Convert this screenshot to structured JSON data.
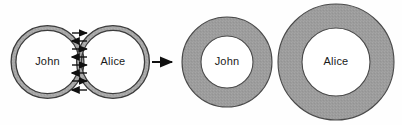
{
  "diagram": {
    "background_color": "#fefefe",
    "before": {
      "name": "before-state",
      "description": "Two thin overlapping rings exchanging messages",
      "circles": [
        {
          "id": "john",
          "label": "John",
          "cx": 47.5,
          "cy": 62,
          "r": 34,
          "ring_thickness": 3.5,
          "ring_fill": "#a8a8a8",
          "stroke": "#3c3c3c",
          "interior_fill": "#ffffff",
          "label_x": 47.5,
          "label_y": 62
        },
        {
          "id": "alice",
          "label": "Alice",
          "cx": 113,
          "cy": 62,
          "r": 34,
          "ring_thickness": 3.5,
          "ring_fill": "#a8a8a8",
          "stroke": "#3c3c3c",
          "interior_fill": "#ffffff",
          "label_x": 113,
          "label_y": 62
        }
      ],
      "exchange_arrows": {
        "name": "message-exchange-arrows",
        "count": 8,
        "color": "#101010",
        "axis_x": 80,
        "items": [
          {
            "y": 33,
            "direction": "right"
          },
          {
            "y": 41,
            "direction": "left"
          },
          {
            "y": 49,
            "direction": "right"
          },
          {
            "y": 57,
            "direction": "left"
          },
          {
            "y": 65,
            "direction": "right"
          },
          {
            "y": 73,
            "direction": "left"
          },
          {
            "y": 81,
            "direction": "right"
          },
          {
            "y": 90,
            "direction": "left"
          }
        ]
      }
    },
    "transition_arrow": {
      "name": "transition-arrow",
      "symbol": "→",
      "direction": "right",
      "color": "#101010",
      "x1": 152,
      "x2": 174,
      "y": 62
    },
    "after": {
      "name": "after-state",
      "description": "Two thick separate annuli, touching",
      "circles": [
        {
          "id": "john",
          "label": "John",
          "cx": 227,
          "cy": 62,
          "r_outer": 45,
          "r_inner": 26,
          "ring_fill": "#9c9c9c",
          "stroke": "#4a4a4a",
          "interior_fill": "#ffffff",
          "label_x": 227,
          "label_y": 62
        },
        {
          "id": "alice",
          "label": "Alice",
          "cx": 336,
          "cy": 62,
          "r_outer": 58,
          "r_inner": 34,
          "ring_fill": "#9c9c9c",
          "stroke": "#4a4a4a",
          "interior_fill": "#ffffff",
          "label_x": 336,
          "label_y": 62
        }
      ]
    }
  }
}
